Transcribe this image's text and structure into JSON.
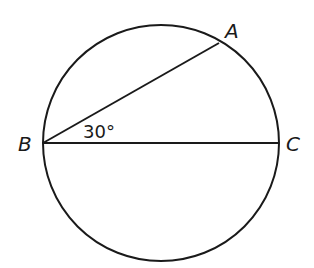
{
  "diagram": {
    "type": "circle-geometry",
    "circle": {
      "cx": 161,
      "cy": 143,
      "r": 118
    },
    "points": {
      "A": {
        "label": "A",
        "x": 219,
        "y": 43
      },
      "B": {
        "label": "B",
        "x": 43,
        "y": 143
      },
      "C": {
        "label": "C",
        "x": 279,
        "y": 143
      }
    },
    "segments": [
      "BA",
      "BC"
    ],
    "angle": {
      "vertex": "B",
      "label": "30°",
      "value": 30
    },
    "stroke_color": "#1a1a1a"
  }
}
